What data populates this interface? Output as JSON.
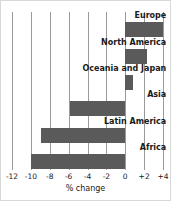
{
  "chart_data": {
    "type": "bar",
    "orientation": "horizontal",
    "title": "",
    "xlabel": "% change",
    "ylabel": "",
    "xlim": [
      -12,
      4
    ],
    "xticks": [
      -12,
      -10,
      -8,
      -6,
      -4,
      -2,
      0,
      2,
      4
    ],
    "xtick_labels": [
      "-12",
      "-10",
      "-8",
      "-6",
      "-4",
      "-2",
      "0",
      "+2",
      "+4"
    ],
    "grid": true,
    "legend": false,
    "categories": [
      "Europe",
      "North America",
      "Oceania and Japan",
      "Asia",
      "Latin America",
      "Africa"
    ],
    "values": [
      4.0,
      2.3,
      0.8,
      -5.9,
      -8.9,
      -10.0
    ],
    "bar_color": "#5a5a5a",
    "gridline_color": "#9a9a9a",
    "background_color": "#ffffff"
  },
  "bars": [
    {
      "label": "Europe",
      "value": 4.0
    },
    {
      "label": "North America",
      "value": 2.3
    },
    {
      "label": "Oceania and Japan",
      "value": 0.8
    },
    {
      "label": "Asia",
      "value": -5.9
    },
    {
      "label": "Latin America",
      "value": -8.9
    },
    {
      "label": "Africa",
      "value": -10.0
    }
  ],
  "axis": {
    "ticks": [
      {
        "label": "-12",
        "value": -12
      },
      {
        "label": "-10",
        "value": -10
      },
      {
        "label": "-8",
        "value": -8
      },
      {
        "label": "-6",
        "value": -6
      },
      {
        "label": "-4",
        "value": -4
      },
      {
        "label": "-2",
        "value": -2
      },
      {
        "label": "0",
        "value": 0
      },
      {
        "label": "+2",
        "value": 2
      },
      {
        "label": "+4",
        "value": 4
      }
    ],
    "title": "% change"
  }
}
